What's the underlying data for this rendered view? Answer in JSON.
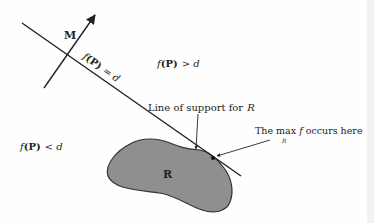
{
  "diagram": {
    "type": "support-line-optimization",
    "colors": {
      "ink": "#222222",
      "region_fill": "#8f8f8f",
      "region_stroke": "#333333",
      "background": "#fefefe"
    },
    "normal_vector": {
      "label": "M"
    },
    "level_line": {
      "label_f": "f",
      "label_arg": "(P)",
      "label_rhs": "= d"
    },
    "regions": {
      "above": {
        "f": "f",
        "arg": "(P)",
        "rel": "> d"
      },
      "below": {
        "f": "f",
        "arg": "(P)",
        "rel": "< d"
      }
    },
    "support_line_caption": {
      "text": "Line of support for",
      "target": "R"
    },
    "max_caption": {
      "pre": "The max ",
      "f": "f",
      "post": " occurs here",
      "sub": "R"
    },
    "region_label": "R"
  }
}
